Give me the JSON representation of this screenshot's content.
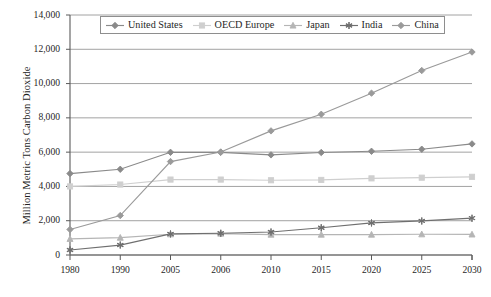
{
  "chart_data": {
    "type": "line",
    "title": "",
    "xlabel": "",
    "ylabel": "Million Metric Tons Carbon Dioxide",
    "categories": [
      "1980",
      "1990",
      "2005",
      "2006",
      "2010",
      "2015",
      "2020",
      "2025",
      "2030"
    ],
    "ylim": [
      0,
      14000
    ],
    "yticks": [
      0,
      2000,
      4000,
      6000,
      8000,
      10000,
      12000,
      14000
    ],
    "ytick_labels": [
      "0",
      "2,000",
      "4,000",
      "6,000",
      "8,000",
      "10,000",
      "12,000",
      "14,000"
    ],
    "grid": true,
    "legend_position": "top-center",
    "series": [
      {
        "name": "United States",
        "marker": "diamond",
        "color": "#8a8a8a",
        "values": [
          4750,
          5000,
          5990,
          5990,
          5840,
          5980,
          6050,
          6170,
          6480
        ]
      },
      {
        "name": "OECD Europe",
        "marker": "square",
        "color": "#cfcfcf",
        "values": [
          4000,
          4110,
          4400,
          4400,
          4360,
          4380,
          4470,
          4510,
          4560
        ]
      },
      {
        "name": "Japan",
        "marker": "triangle",
        "color": "#b5b5b5",
        "values": [
          940,
          1010,
          1210,
          1250,
          1190,
          1190,
          1190,
          1210,
          1200
        ]
      },
      {
        "name": "India",
        "marker": "asterisk",
        "color": "#6f6f6f",
        "values": [
          290,
          580,
          1230,
          1270,
          1340,
          1590,
          1870,
          1990,
          2150
        ]
      },
      {
        "name": "China",
        "marker": "diamond",
        "color": "#9a9a9a",
        "values": [
          1490,
          2300,
          5450,
          6010,
          7240,
          8210,
          9440,
          10760,
          11840
        ]
      }
    ]
  },
  "legend": {
    "items": [
      {
        "label": "United States",
        "marker": "diamond-marker-icon"
      },
      {
        "label": "OECD Europe",
        "marker": "square-marker-icon"
      },
      {
        "label": "Japan",
        "marker": "triangle-marker-icon"
      },
      {
        "label": "India",
        "marker": "asterisk-marker-icon"
      },
      {
        "label": "China",
        "marker": "diamond-marker-icon"
      }
    ]
  },
  "caption": {
    "text": ""
  }
}
